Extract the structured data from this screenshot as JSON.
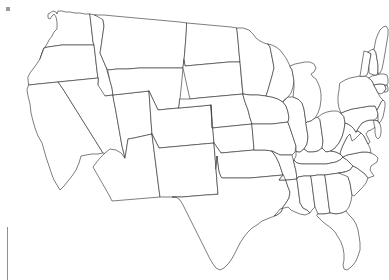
{
  "page": {
    "kind": "blank-us-states-outline-map",
    "width": 389,
    "height": 280,
    "background_color": "#ffffff",
    "has_labels": false,
    "has_legend": false,
    "has_title_text": false
  },
  "map": {
    "name": "united-states-contiguous",
    "projection_look": "albers-usa-like",
    "outline_color": "#2e2e2e",
    "fill_color": "#ffffff",
    "stroke_width_px": 0.62,
    "regions_shown": "48 contiguous states",
    "excluded": [
      "Alaska",
      "Hawaii"
    ],
    "states": [
      "Washington",
      "Oregon",
      "California",
      "Idaho",
      "Nevada",
      "Utah",
      "Arizona",
      "Montana",
      "Wyoming",
      "Colorado",
      "New Mexico",
      "North Dakota",
      "South Dakota",
      "Nebraska",
      "Kansas",
      "Oklahoma",
      "Texas",
      "Minnesota",
      "Iowa",
      "Missouri",
      "Arkansas",
      "Louisiana",
      "Wisconsin",
      "Illinois",
      "Michigan",
      "Indiana",
      "Ohio",
      "Kentucky",
      "Tennessee",
      "Mississippi",
      "Alabama",
      "Georgia",
      "Florida",
      "South Carolina",
      "North Carolina",
      "Virginia",
      "West Virginia",
      "Maryland",
      "Delaware",
      "Pennsylvania",
      "New Jersey",
      "New York",
      "Connecticut",
      "Rhode Island",
      "Massachusetts",
      "Vermont",
      "New Hampshire",
      "Maine"
    ]
  },
  "marks": {
    "corner_dot": {
      "label": "corner dot mark",
      "color": "#9a9a9a",
      "x": 6,
      "y": 7,
      "size": 4
    },
    "margin_rule": {
      "label": "vertical margin rule",
      "color": "#8f8f8f",
      "x": 7,
      "y": 227,
      "length": 53
    }
  }
}
